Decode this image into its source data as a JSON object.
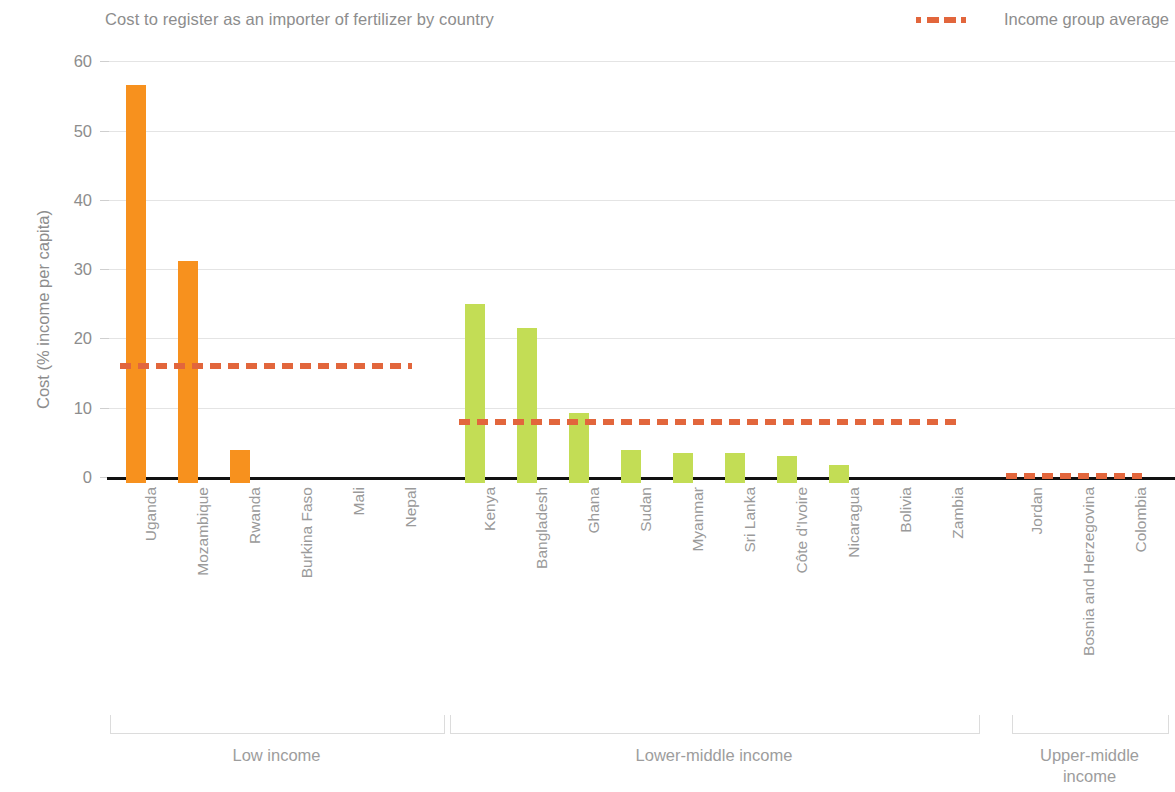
{
  "chart_data": {
    "type": "bar",
    "title": "Cost to register as an importer of fertilizer by country",
    "xlabel": "",
    "ylabel": "Cost (% income per capita)",
    "ylim": [
      0,
      60
    ],
    "yticks": [
      0,
      10,
      20,
      30,
      40,
      50,
      60
    ],
    "grid": true,
    "legend_position": "top-right",
    "legend": [
      {
        "name": "Income group average",
        "style": "dashed-line",
        "color": "#E2663C"
      }
    ],
    "categories": [
      "Uganda",
      "Mozambique",
      "Rwanda",
      "Burkina Faso",
      "Mali",
      "Nepal",
      "Kenya",
      "Bangladesh",
      "Ghana",
      "Sudan",
      "Myanmar",
      "Sri Lanka",
      "Côte d'Ivoire",
      "Nicaragua",
      "Bolivia",
      "Zambia",
      "Jordan",
      "Bosnia and Herzegovina",
      "Colombia"
    ],
    "values": [
      57.5,
      32.1,
      4.8,
      0,
      0,
      0,
      25.8,
      22.3,
      10.1,
      4.8,
      4.3,
      4.3,
      3.9,
      2.6,
      0,
      0,
      0,
      0,
      0
    ],
    "bars": [
      {
        "label": "Uganda",
        "value": 57.5,
        "group": "Low income",
        "color": "#F7911E"
      },
      {
        "label": "Mozambique",
        "value": 32.1,
        "group": "Low income",
        "color": "#F7911E"
      },
      {
        "label": "Rwanda",
        "value": 4.8,
        "group": "Low income",
        "color": "#F7911E"
      },
      {
        "label": "Burkina Faso",
        "value": 0,
        "group": "Low income",
        "color": "#F7911E"
      },
      {
        "label": "Mali",
        "value": 0,
        "group": "Low income",
        "color": "#F7911E"
      },
      {
        "label": "Nepal",
        "value": 0,
        "group": "Low income",
        "color": "#F7911E"
      },
      {
        "label": "Kenya",
        "value": 25.8,
        "group": "Lower-middle income",
        "color": "#C3DD55"
      },
      {
        "label": "Bangladesh",
        "value": 22.3,
        "group": "Lower-middle income",
        "color": "#C3DD55"
      },
      {
        "label": "Ghana",
        "value": 10.1,
        "group": "Lower-middle income",
        "color": "#C3DD55"
      },
      {
        "label": "Sudan",
        "value": 4.8,
        "group": "Lower-middle income",
        "color": "#C3DD55"
      },
      {
        "label": "Myanmar",
        "value": 4.3,
        "group": "Lower-middle income",
        "color": "#C3DD55"
      },
      {
        "label": "Sri Lanka",
        "value": 4.3,
        "group": "Lower-middle income",
        "color": "#C3DD55"
      },
      {
        "label": "Côte d'Ivoire",
        "value": 3.9,
        "group": "Lower-middle income",
        "color": "#C3DD55"
      },
      {
        "label": "Nicaragua",
        "value": 2.6,
        "group": "Lower-middle income",
        "color": "#C3DD55"
      },
      {
        "label": "Bolivia",
        "value": 0,
        "group": "Lower-middle income",
        "color": "#C3DD55"
      },
      {
        "label": "Zambia",
        "value": 0,
        "group": "Lower-middle income",
        "color": "#C3DD55"
      },
      {
        "label": "Jordan",
        "value": 0,
        "group": "Upper-middle income",
        "color": "#C3DD55"
      },
      {
        "label": "Bosnia and Herzegovina",
        "value": 0,
        "group": "Upper-middle income",
        "color": "#C3DD55"
      },
      {
        "label": "Colombia",
        "value": 0,
        "group": "Upper-middle income",
        "color": "#C3DD55"
      }
    ],
    "groups": [
      {
        "label": "Low income",
        "average": 16.0,
        "start_index": 0,
        "end_index": 5
      },
      {
        "label": "Lower-middle income",
        "average": 8.0,
        "start_index": 6,
        "end_index": 15
      },
      {
        "label": "Upper-middle income",
        "average": 0.2,
        "start_index": 16,
        "end_index": 18
      }
    ],
    "colors": {
      "low_income_bar": "#F7911E",
      "lower_middle_bar": "#C3DD55",
      "average_line": "#E2663C",
      "axis": "#111111",
      "grid": "#e4e4e4",
      "text": "#8d8d8d"
    }
  }
}
